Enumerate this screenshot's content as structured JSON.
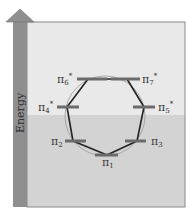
{
  "diagram": {
    "axis_label": "Energy",
    "colors": {
      "upper_bg": "#e9e9e9",
      "lower_bg": "#d3d3d3",
      "arrow": "#8f8f8f",
      "bar": "#6b6b6b",
      "ring": "#222222",
      "circle": "#999999"
    },
    "orbitals": [
      {
        "id": "pi1",
        "label": "π",
        "sub": "1",
        "star": ""
      },
      {
        "id": "pi2",
        "label": "π",
        "sub": "2",
        "star": ""
      },
      {
        "id": "pi3",
        "label": "π",
        "sub": "3",
        "star": ""
      },
      {
        "id": "pi4",
        "label": "π",
        "sub": "4",
        "star": "*"
      },
      {
        "id": "pi5",
        "label": "π",
        "sub": "5",
        "star": "*"
      },
      {
        "id": "pi6",
        "label": "π",
        "sub": "6",
        "star": "*"
      },
      {
        "id": "pi7",
        "label": "π",
        "sub": "7",
        "star": "*"
      }
    ]
  }
}
